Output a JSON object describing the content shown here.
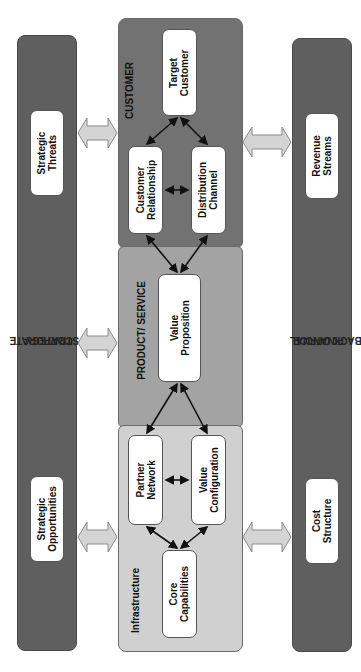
{
  "diagram": {
    "colors": {
      "side_bars": "#5f5f5f",
      "customer_section": "#727272",
      "product_section": "#a3a3a3",
      "infrastructure_section": "#d0d0d0",
      "node_fill": "#ffffff",
      "double_arrow_fill": "#d4d4d4"
    },
    "left_bar": {
      "label_line1": "CORPORATE",
      "label_line2": "STRATEGY",
      "nodes": [
        {
          "line1": "Strategic",
          "line2": "Threats"
        },
        {
          "line1": "Strategic",
          "line2": "Opportunities"
        }
      ]
    },
    "right_bar": {
      "label_line1": "FINANCIAL",
      "label_line2": "BACK OFFICE",
      "nodes": [
        {
          "line1": "Revenue",
          "line2": "Streams"
        },
        {
          "line1": "Cost",
          "line2": "Structure"
        }
      ]
    },
    "center": {
      "customer": {
        "label": "CUSTOMER",
        "nodes": [
          {
            "line1": "Target",
            "line2": "Customer"
          },
          {
            "line1": "Customer",
            "line2": "Relationship"
          },
          {
            "line1": "Distribution",
            "line2": "Channel"
          }
        ]
      },
      "product": {
        "label": "PRODUCT/ SERVICE",
        "nodes": [
          {
            "line1": "Value",
            "line2": "Proposition"
          }
        ]
      },
      "infrastructure": {
        "label": "Infrastructure",
        "nodes": [
          {
            "line1": "Partner",
            "line2": "Network"
          },
          {
            "line1": "Value",
            "line2": "Configuration"
          },
          {
            "line1": "Core",
            "line2": "Capabilities"
          }
        ]
      }
    }
  }
}
